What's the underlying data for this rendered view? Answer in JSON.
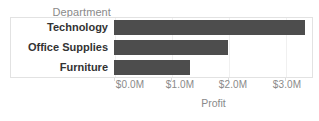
{
  "chart_data": {
    "type": "bar",
    "orientation": "horizontal",
    "title": "",
    "xlabel": "Profit",
    "ylabel": "Department",
    "categories": [
      "Technology",
      "Office Supplies",
      "Furniture"
    ],
    "values": [
      3.35,
      2.0,
      1.33
    ],
    "value_unit": "M",
    "value_prefix": "$",
    "xlim": [
      0,
      3.5
    ],
    "xticks": [
      0,
      1,
      2,
      3
    ],
    "xtick_labels": [
      "$0.0M",
      "$1.0M",
      "$2.0M",
      "$3.0M"
    ],
    "grid": true,
    "legend": null,
    "series": [
      {
        "name": "Profit",
        "color": "#4d4d4d",
        "values": [
          3.35,
          2.0,
          1.33
        ]
      }
    ]
  },
  "field_caption": "Department",
  "axis": {
    "title": "Profit",
    "ticks": [
      "$0.0M",
      "$1.0M",
      "$2.0M",
      "$3.0M"
    ]
  },
  "rows": [
    {
      "label": "Technology"
    },
    {
      "label": "Office Supplies"
    },
    {
      "label": "Furniture"
    }
  ],
  "colors": {
    "bar": "#4d4d4d",
    "frame_border": "#e2e2e2",
    "gridline": "#f0f0f0",
    "label_text": "#333333",
    "muted_text": "#8a8a8a",
    "background": "#ffffff"
  }
}
